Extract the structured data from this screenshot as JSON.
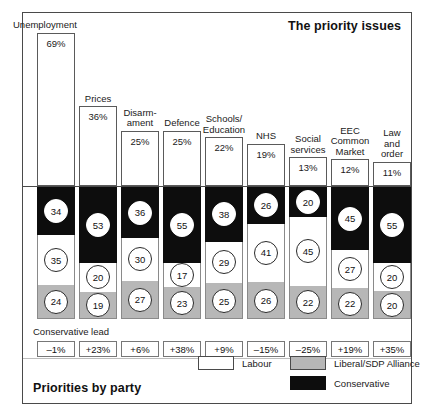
{
  "title": "The priority issues",
  "footer_title": "Priorities by party",
  "lead_caption": "Conservative lead",
  "legend": [
    {
      "key": "labour",
      "label": "Labour",
      "color": "#ffffff"
    },
    {
      "key": "alliance",
      "label": "Liberal/SDP Alliance",
      "color": "#b7b7b7"
    },
    {
      "key": "conservative",
      "label": "Conservative",
      "color": "#0d0d0d"
    }
  ],
  "chart_data": {
    "type": "bar",
    "title": "The priority issues",
    "subtitle": "Priorities by party",
    "xlabel": "",
    "ylabel": "",
    "categories": [
      "Unemployment",
      "Prices",
      "Disarm-\name nt",
      "Defence",
      "Schools/\nEducation",
      "NHS",
      "Social\nservices",
      "EEC\nCommon\nMarket",
      "Law\nand\norder"
    ],
    "priority_percent": [
      69,
      36,
      25,
      25,
      22,
      19,
      13,
      12,
      11
    ],
    "priority_percent_labels": [
      "69%",
      "36%",
      "25%",
      "25%",
      "22%",
      "19%",
      "13%",
      "12%",
      "11%"
    ],
    "series": [
      {
        "name": "Conservative",
        "color": "#0d0d0d",
        "values": [
          34,
          53,
          36,
          55,
          38,
          26,
          20,
          45,
          55
        ]
      },
      {
        "name": "Labour",
        "color": "#ffffff",
        "values": [
          35,
          20,
          30,
          17,
          29,
          41,
          45,
          27,
          20
        ]
      },
      {
        "name": "Liberal/SDP Alliance",
        "color": "#b7b7b7",
        "values": [
          24,
          19,
          27,
          23,
          25,
          26,
          22,
          22,
          20
        ]
      }
    ],
    "conservative_lead": [
      "–1%",
      "+23%",
      "+6%",
      "+38%",
      "+9%",
      "–15%",
      "–25%",
      "+19%",
      "+35%"
    ],
    "ylim": [
      0,
      100
    ],
    "grid": false,
    "legend_position": "bottom-right"
  },
  "columns": [
    {
      "issue": "Unemployment",
      "issue_lines": [
        "Unemployment"
      ],
      "pct": "69%",
      "pct_value": 69,
      "con": 34,
      "lab": 35,
      "all": 24,
      "lead": "–1%"
    },
    {
      "issue": "Prices",
      "issue_lines": [
        "Prices"
      ],
      "pct": "36%",
      "pct_value": 36,
      "con": 53,
      "lab": 20,
      "all": 19,
      "lead": "+23%"
    },
    {
      "issue": "Disarmament",
      "issue_lines": [
        "Disarm-",
        "ament"
      ],
      "pct": "25%",
      "pct_value": 25,
      "con": 36,
      "lab": 30,
      "all": 27,
      "lead": "+6%"
    },
    {
      "issue": "Defence",
      "issue_lines": [
        "Defence"
      ],
      "pct": "25%",
      "pct_value": 25,
      "con": 55,
      "lab": 17,
      "all": 23,
      "lead": "+38%"
    },
    {
      "issue": "Schools/Education",
      "issue_lines": [
        "Schools/",
        "Education"
      ],
      "pct": "22%",
      "pct_value": 22,
      "con": 38,
      "lab": 29,
      "all": 25,
      "lead": "+9%"
    },
    {
      "issue": "NHS",
      "issue_lines": [
        "NHS"
      ],
      "pct": "19%",
      "pct_value": 19,
      "con": 26,
      "lab": 41,
      "all": 26,
      "lead": "–15%"
    },
    {
      "issue": "Social services",
      "issue_lines": [
        "Social",
        "services"
      ],
      "pct": "13%",
      "pct_value": 13,
      "con": 20,
      "lab": 45,
      "all": 22,
      "lead": "–25%"
    },
    {
      "issue": "EEC Common Market",
      "issue_lines": [
        "EEC",
        "Common",
        "Market"
      ],
      "pct": "12%",
      "pct_value": 12,
      "con": 45,
      "lab": 27,
      "all": 22,
      "lead": "+19%"
    },
    {
      "issue": "Law and order",
      "issue_lines": [
        "Law",
        "and",
        "order"
      ],
      "pct": "11%",
      "pct_value": 11,
      "con": 55,
      "lab": 20,
      "all": 20,
      "lead": "+35%"
    }
  ]
}
